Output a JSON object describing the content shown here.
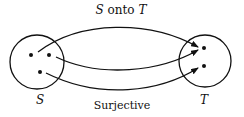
{
  "diagram": {
    "title": "S onto T",
    "title_parts": {
      "a": "S",
      "mid": " onto ",
      "b": "T"
    },
    "caption": "Surjective",
    "domain_label": "S",
    "codomain_label": "T",
    "domain_elements": 3,
    "codomain_elements": 2,
    "mappings": [
      {
        "from": 0,
        "to": 0
      },
      {
        "from": 1,
        "to": 0
      },
      {
        "from": 2,
        "to": 1
      }
    ],
    "colors": {
      "stroke": "#111111",
      "background": "#ffffff"
    }
  }
}
